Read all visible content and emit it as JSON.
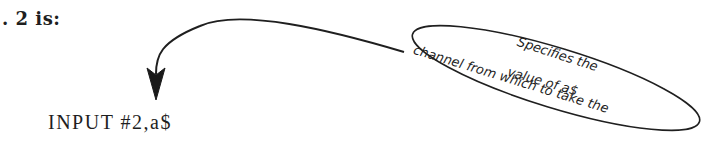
{
  "page": {
    "heading_fragment": ". 2 is:",
    "code_example": "INPUT #2,a$"
  },
  "callout": {
    "lines": [
      "Specifies the",
      "channel from which to take the",
      "value of a$"
    ],
    "shape": "ellipse",
    "arrow_target": "code_example"
  },
  "colors": {
    "ink": "#1f1f1f",
    "paper": "#ffffff"
  }
}
